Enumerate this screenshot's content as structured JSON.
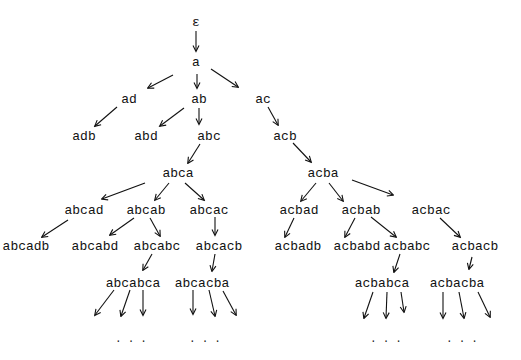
{
  "diagram": {
    "type": "tree",
    "nodes": [
      {
        "id": "eps",
        "label": "ε",
        "x": 196,
        "y": 22
      },
      {
        "id": "a",
        "label": "a",
        "x": 196,
        "y": 62
      },
      {
        "id": "ad",
        "label": "ad",
        "x": 129,
        "y": 99
      },
      {
        "id": "ab",
        "label": "ab",
        "x": 199,
        "y": 99
      },
      {
        "id": "ac",
        "label": "ac",
        "x": 263,
        "y": 99
      },
      {
        "id": "adb",
        "label": "adb",
        "x": 84,
        "y": 136
      },
      {
        "id": "abd",
        "label": "abd",
        "x": 146,
        "y": 136
      },
      {
        "id": "abc",
        "label": "abc",
        "x": 209,
        "y": 136
      },
      {
        "id": "acb",
        "label": "acb",
        "x": 285,
        "y": 136
      },
      {
        "id": "abca",
        "label": "abca",
        "x": 178,
        "y": 173
      },
      {
        "id": "acba",
        "label": "acba",
        "x": 323,
        "y": 173
      },
      {
        "id": "abcad",
        "label": "abcad",
        "x": 84,
        "y": 210
      },
      {
        "id": "abcab",
        "label": "abcab",
        "x": 146,
        "y": 210
      },
      {
        "id": "abcac",
        "label": "abcac",
        "x": 209,
        "y": 210
      },
      {
        "id": "acbad",
        "label": "acbad",
        "x": 299,
        "y": 210
      },
      {
        "id": "acbab",
        "label": "acbab",
        "x": 361,
        "y": 210
      },
      {
        "id": "acbac",
        "label": "acbac",
        "x": 431,
        "y": 210
      },
      {
        "id": "abcadb",
        "label": "abcadb",
        "x": 26,
        "y": 246
      },
      {
        "id": "abcabd",
        "label": "abcabd",
        "x": 95,
        "y": 246
      },
      {
        "id": "abcabc",
        "label": "abcabc",
        "x": 157,
        "y": 246
      },
      {
        "id": "abcacb",
        "label": "abcacb",
        "x": 219,
        "y": 246
      },
      {
        "id": "acbadb",
        "label": "acbadb",
        "x": 298,
        "y": 246
      },
      {
        "id": "acbabd",
        "label": "acbabd",
        "x": 357,
        "y": 246
      },
      {
        "id": "acbabc",
        "label": "acbabc",
        "x": 407,
        "y": 246
      },
      {
        "id": "acbacb",
        "label": "acbacb",
        "x": 475,
        "y": 246
      },
      {
        "id": "abcabca",
        "label": "abcabca",
        "x": 133,
        "y": 283
      },
      {
        "id": "abcacba",
        "label": "abcacba",
        "x": 202,
        "y": 283
      },
      {
        "id": "acbabca",
        "label": "acbabca",
        "x": 382,
        "y": 283
      },
      {
        "id": "acbacba",
        "label": "acbacba",
        "x": 457,
        "y": 283
      }
    ],
    "edges": [
      {
        "from": [
          196,
          31
        ],
        "to": [
          196,
          51
        ]
      },
      {
        "from": [
          173,
          75
        ],
        "to": [
          148,
          88
        ]
      },
      {
        "from": [
          197,
          74
        ],
        "to": [
          197,
          88
        ]
      },
      {
        "from": [
          211,
          69
        ],
        "to": [
          238,
          87
        ]
      },
      {
        "from": [
          117,
          107
        ],
        "to": [
          95,
          126
        ]
      },
      {
        "from": [
          184,
          108
        ],
        "to": [
          160,
          126
        ]
      },
      {
        "from": [
          199,
          108
        ],
        "to": [
          199,
          124
        ]
      },
      {
        "from": [
          268,
          107
        ],
        "to": [
          278,
          125
        ]
      },
      {
        "from": [
          293,
          143
        ],
        "to": [
          311,
          162
        ]
      },
      {
        "from": [
          200,
          144
        ],
        "to": [
          188,
          163
        ]
      },
      {
        "from": [
          145,
          183
        ],
        "to": [
          102,
          199
        ]
      },
      {
        "from": [
          169,
          183
        ],
        "to": [
          155,
          200
        ]
      },
      {
        "from": [
          185,
          183
        ],
        "to": [
          204,
          200
        ]
      },
      {
        "from": [
          215,
          217
        ],
        "to": [
          215,
          235
        ]
      },
      {
        "from": [
          68,
          220
        ],
        "to": [
          42,
          237
        ]
      },
      {
        "from": [
          134,
          218
        ],
        "to": [
          110,
          235
        ]
      },
      {
        "from": [
          150,
          218
        ],
        "to": [
          160,
          236
        ]
      },
      {
        "from": [
          316,
          183
        ],
        "to": [
          301,
          201
        ]
      },
      {
        "from": [
          329,
          183
        ],
        "to": [
          343,
          201
        ]
      },
      {
        "from": [
          352,
          180
        ],
        "to": [
          393,
          195
        ]
      },
      {
        "from": [
          294,
          218
        ],
        "to": [
          285,
          237
        ]
      },
      {
        "from": [
          355,
          218
        ],
        "to": [
          345,
          237
        ]
      },
      {
        "from": [
          371,
          217
        ],
        "to": [
          396,
          237
        ]
      },
      {
        "from": [
          440,
          218
        ],
        "to": [
          460,
          237
        ]
      },
      {
        "from": [
          152,
          254
        ],
        "to": [
          143,
          270
        ]
      },
      {
        "from": [
          215,
          254
        ],
        "to": [
          212,
          271
        ]
      },
      {
        "from": [
          400,
          254
        ],
        "to": [
          394,
          272
        ]
      },
      {
        "from": [
          472,
          257
        ],
        "to": [
          469,
          269
        ]
      },
      {
        "from": [
          114,
          290
        ],
        "to": [
          95,
          315
        ]
      },
      {
        "from": [
          130,
          290
        ],
        "to": [
          121,
          316
        ]
      },
      {
        "from": [
          143,
          290
        ],
        "to": [
          143,
          315
        ]
      },
      {
        "from": [
          193,
          290
        ],
        "to": [
          193,
          314
        ]
      },
      {
        "from": [
          209,
          290
        ],
        "to": [
          215,
          316
        ]
      },
      {
        "from": [
          223,
          291
        ],
        "to": [
          236,
          315
        ]
      },
      {
        "from": [
          373,
          292
        ],
        "to": [
          364,
          318
        ]
      },
      {
        "from": [
          387,
          292
        ],
        "to": [
          386,
          318
        ]
      },
      {
        "from": [
          401,
          292
        ],
        "to": [
          404,
          312
        ]
      },
      {
        "from": [
          443,
          292
        ],
        "to": [
          443,
          318
        ]
      },
      {
        "from": [
          459,
          292
        ],
        "to": [
          464,
          318
        ]
      },
      {
        "from": [
          478,
          292
        ],
        "to": [
          490,
          317
        ]
      }
    ],
    "continuation_dots": [
      {
        "text": "...",
        "x": 134,
        "y": 339
      },
      {
        "text": "...",
        "x": 208,
        "y": 339
      },
      {
        "text": "...",
        "x": 389,
        "y": 339
      },
      {
        "text": "...",
        "x": 465,
        "y": 339
      }
    ]
  }
}
